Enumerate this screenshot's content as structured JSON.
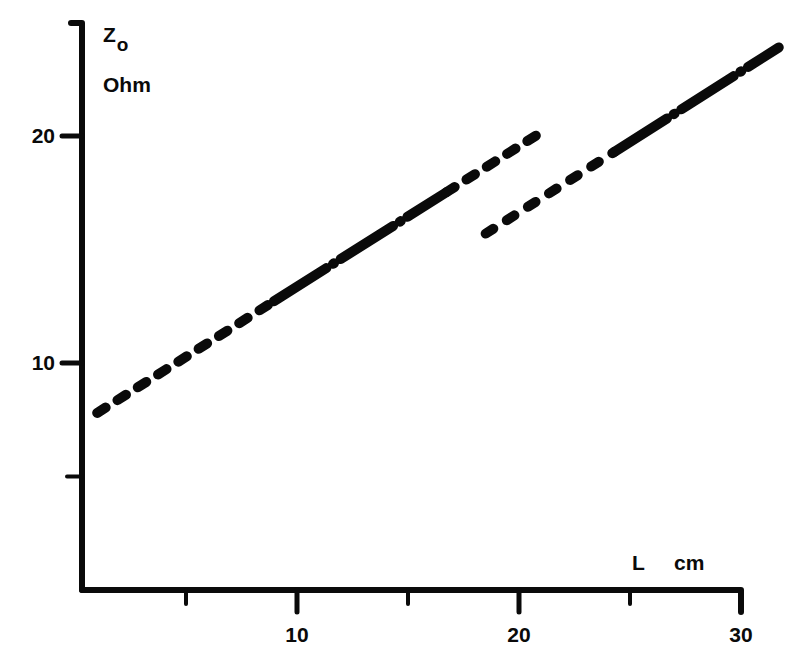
{
  "chart_data": {
    "type": "line",
    "title": "",
    "xlabel": "L",
    "xunit": "cm",
    "ylabel": "Zo",
    "ylabel_main": "Z",
    "ylabel_sub": "o",
    "yunit": "Ohm",
    "xlim": [
      0.3,
      30
    ],
    "ylim": [
      0,
      25
    ],
    "xticks": [
      5,
      10,
      15,
      20,
      25,
      30
    ],
    "xtick_labels": [
      "",
      "10",
      "",
      "20",
      "",
      "30"
    ],
    "yticks": [
      5,
      10,
      20
    ],
    "ytick_labels": [
      "",
      "10",
      "20"
    ],
    "grid": false,
    "legend": null,
    "series": [
      {
        "name": "line-1",
        "style": "dash / dash-dot / dash",
        "x": [
          1.0,
          20.9
        ],
        "y": [
          7.8,
          20.1
        ]
      },
      {
        "name": "line-2",
        "style": "dash / dash-dot",
        "x": [
          18.5,
          31.7
        ],
        "y": [
          15.7,
          23.9
        ]
      }
    ]
  },
  "colors": {
    "ink": "#0a0a0a",
    "background": "#ffffff"
  }
}
